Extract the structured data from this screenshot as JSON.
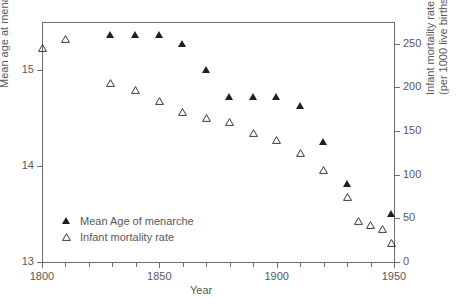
{
  "chart_data": {
    "type": "scatter",
    "title": "",
    "xlabel": "Year",
    "ylabel_left": "Mean age at menarche (yr)",
    "ylabel_right_line1": "Infant mortality rate",
    "ylabel_right_line2": "(per 1000 live births)",
    "xlim": [
      1800,
      1950
    ],
    "ylim_left": [
      13,
      15.5
    ],
    "ylim_right": [
      0,
      275
    ],
    "x_ticks_major": [
      1800,
      1850,
      1900,
      1950
    ],
    "x_tick_labels": [
      "1800",
      "1850",
      "1900",
      "1950"
    ],
    "x_ticks_minor": [
      1810,
      1820,
      1830,
      1840,
      1860,
      1870,
      1880,
      1890,
      1910,
      1920,
      1930,
      1940
    ],
    "y_ticks_left": [
      13,
      14,
      15
    ],
    "y_tick_labels_left": [
      "13",
      "14",
      "15"
    ],
    "y_ticks_right": [
      0,
      50,
      100,
      150,
      200,
      250
    ],
    "y_tick_labels_right": [
      "0",
      "50",
      "100",
      "150",
      "200",
      "250"
    ],
    "grid": false,
    "legend_position": "inside lower-left",
    "marker_color": "#231f20",
    "axis_color": "#6d6e71",
    "series": [
      {
        "name": "Mean Age of menarche",
        "marker": "filled-triangle",
        "axis": "left",
        "points": [
          {
            "x": 1829,
            "y": 15.36
          },
          {
            "x": 1840,
            "y": 15.36
          },
          {
            "x": 1850,
            "y": 15.36
          },
          {
            "x": 1860,
            "y": 15.27
          },
          {
            "x": 1870,
            "y": 15.0
          },
          {
            "x": 1880,
            "y": 14.72
          },
          {
            "x": 1890,
            "y": 14.72
          },
          {
            "x": 1900,
            "y": 14.72
          },
          {
            "x": 1910,
            "y": 14.63
          },
          {
            "x": 1920,
            "y": 14.25
          },
          {
            "x": 1930,
            "y": 13.81
          },
          {
            "x": 1949,
            "y": 13.5
          }
        ]
      },
      {
        "name": "Infant mortality rate",
        "marker": "open-triangle",
        "axis": "right",
        "points": [
          {
            "x": 1800,
            "y": 245
          },
          {
            "x": 1810,
            "y": 255
          },
          {
            "x": 1829,
            "y": 205
          },
          {
            "x": 1840,
            "y": 197
          },
          {
            "x": 1850,
            "y": 185
          },
          {
            "x": 1860,
            "y": 172
          },
          {
            "x": 1870,
            "y": 165
          },
          {
            "x": 1880,
            "y": 160
          },
          {
            "x": 1890,
            "y": 148
          },
          {
            "x": 1900,
            "y": 140
          },
          {
            "x": 1910,
            "y": 125
          },
          {
            "x": 1920,
            "y": 105
          },
          {
            "x": 1930,
            "y": 75
          },
          {
            "x": 1935,
            "y": 47
          },
          {
            "x": 1940,
            "y": 42
          },
          {
            "x": 1945,
            "y": 38
          },
          {
            "x": 1949,
            "y": 22
          }
        ]
      }
    ]
  },
  "legend": {
    "items": [
      {
        "label": "Mean Age of menarche",
        "marker": "filled-triangle"
      },
      {
        "label": "Infant mortality rate",
        "marker": "open-triangle"
      }
    ]
  }
}
